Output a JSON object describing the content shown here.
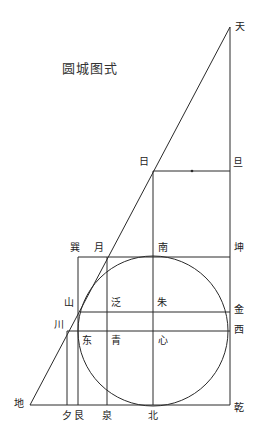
{
  "title": "圆城图式",
  "labels": {
    "tian": "天",
    "ri": "日",
    "dan": "旦",
    "xun": "巽",
    "yue": "月",
    "nan": "南",
    "kun": "坤",
    "shan": "山",
    "fan": "泛",
    "zhu": "朱",
    "jin": "金",
    "chuan": "川",
    "dong": "东",
    "qing": "青",
    "xin": "心",
    "xi": "西",
    "di": "地",
    "xi_dusk": "夕",
    "gen": "艮",
    "quan": "泉",
    "bei": "北",
    "qian": "乾"
  },
  "colors": {
    "line": "#2a2a2a",
    "background": "#ffffff"
  }
}
